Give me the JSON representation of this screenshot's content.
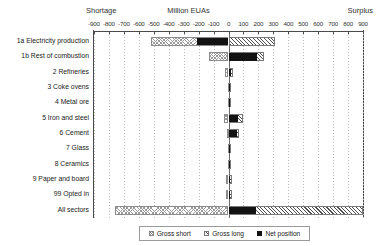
{
  "header": {
    "left_label": "Shortage",
    "center_label": "Million EUAs",
    "right_label": "Surplus"
  },
  "legend": {
    "position": "bottom-center",
    "items": [
      {
        "key": "gross_short",
        "label": "Gross short",
        "swatch": "hatch-cross-light"
      },
      {
        "key": "gross_long",
        "label": "Gross long",
        "swatch": "hatch-diagonal-dark"
      },
      {
        "key": "net_position",
        "label": "Net position",
        "swatch": "solid-black"
      }
    ]
  },
  "chart_data": {
    "type": "bar",
    "orientation": "horizontal",
    "title": "Million EUAs",
    "xlabel": "Million EUAs",
    "ylabel": "",
    "xlim": [
      -900,
      900
    ],
    "grid": true,
    "grid_axis": "x",
    "legend_position": "bottom-center",
    "annotations": [
      "Shortage",
      "Million EUAs",
      "Surplus"
    ],
    "tick_labels": [
      "-900",
      "-800",
      "-700",
      "-600",
      "-500",
      "-400",
      "-300",
      "-200",
      "-100",
      "0",
      "100",
      "200",
      "300",
      "400",
      "500",
      "600",
      "700",
      "800",
      "900"
    ],
    "ticks": [
      -900,
      -800,
      -700,
      -600,
      -500,
      -400,
      -300,
      -200,
      -100,
      0,
      100,
      200,
      300,
      400,
      500,
      600,
      700,
      800,
      900
    ],
    "categories": [
      "1a Electricity production",
      "1b Rest of combustion",
      "2 Refineries",
      "3 Coke ovens",
      "4 Metal ore",
      "5 Iron and steel",
      "6 Cement",
      "7 Glass",
      "8 Ceramics",
      "9 Paper and board",
      "99 Opted in",
      "All sectors"
    ],
    "series": [
      {
        "name": "Gross short",
        "values": [
          -520,
          -130,
          -22,
          -4,
          -2,
          -30,
          -12,
          -5,
          -3,
          -14,
          -16,
          -760
        ]
      },
      {
        "name": "Gross long",
        "values": [
          310,
          240,
          30,
          4,
          2,
          95,
          70,
          6,
          4,
          22,
          26,
          1030
        ]
      },
      {
        "name": "Net position",
        "values": [
          -210,
          190,
          14,
          0,
          0,
          62,
          58,
          2,
          1,
          10,
          12,
          185
        ]
      }
    ]
  }
}
